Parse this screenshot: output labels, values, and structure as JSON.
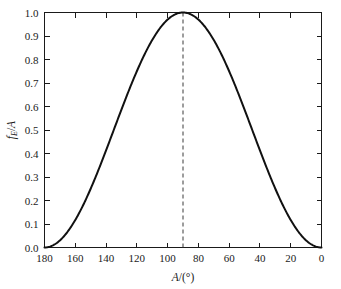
{
  "chart_data": {
    "type": "line",
    "title": "",
    "subtitle": "",
    "xlabel": "A/(°)",
    "ylabel": "fₑ/A",
    "ylabel_parts": {
      "main": "f",
      "subscript": "E",
      "slash": "/",
      "denominator": "A"
    },
    "xlim": [
      180,
      0
    ],
    "ylim": [
      0.0,
      1.0
    ],
    "x_reversed": true,
    "grid": false,
    "legend": null,
    "xticks": [
      180,
      160,
      140,
      120,
      100,
      80,
      60,
      40,
      20,
      0
    ],
    "xtick_labels": [
      "180",
      "160",
      "140",
      "120",
      "100",
      "80",
      "60",
      "40",
      "20",
      "0"
    ],
    "yticks": [
      0.0,
      0.1,
      0.2,
      0.3,
      0.4,
      0.5,
      0.6,
      0.7,
      0.8,
      0.9,
      1.0
    ],
    "ytick_labels": [
      "0.0",
      "0.1",
      "0.2",
      "0.3",
      "0.4",
      "0.5",
      "0.6",
      "0.7",
      "0.8",
      "0.9",
      "1.0"
    ],
    "x": [
      180,
      175,
      170,
      165,
      160,
      155,
      150,
      145,
      140,
      135,
      130,
      125,
      120,
      115,
      110,
      105,
      100,
      95,
      90,
      85,
      80,
      75,
      70,
      65,
      60,
      55,
      50,
      45,
      40,
      35,
      30,
      25,
      20,
      15,
      10,
      5,
      0
    ],
    "values": [
      0.0,
      0.008,
      0.03,
      0.067,
      0.117,
      0.179,
      0.25,
      0.329,
      0.413,
      0.5,
      0.587,
      0.671,
      0.75,
      0.821,
      0.883,
      0.933,
      0.97,
      0.992,
      1.0,
      0.992,
      0.97,
      0.933,
      0.883,
      0.821,
      0.75,
      0.671,
      0.587,
      0.5,
      0.413,
      0.329,
      0.25,
      0.179,
      0.117,
      0.067,
      0.03,
      0.008,
      0.0
    ],
    "series": [
      {
        "name": "f_E/A",
        "formula": "sin^2(A)",
        "color": "#111111",
        "linewidth": 2,
        "style": "solid"
      }
    ],
    "annotations": [
      {
        "name": "peak-guide-line",
        "type": "vline",
        "x": 90,
        "y_from": 0.0,
        "y_to": 1.0,
        "style": "dashed",
        "color": "#3a3a3a"
      }
    ],
    "peak": {
      "x": 90,
      "y": 1.0
    },
    "colors": {
      "curve": "#111111",
      "axis": "#1a1a1a",
      "guide": "#3a3a3a",
      "background": "#ffffff"
    }
  }
}
